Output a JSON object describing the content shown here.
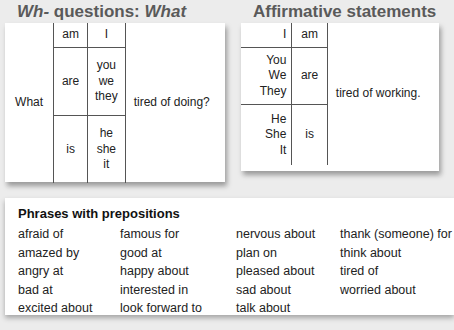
{
  "left_section": {
    "heading_part1": "Wh-",
    "heading_part2": " questions: ",
    "heading_part3": "What",
    "table": {
      "wh_word": "What",
      "rows": [
        {
          "verb": "am",
          "subjects": [
            "I"
          ]
        },
        {
          "verb": "are",
          "subjects": [
            "you",
            "we",
            "they"
          ]
        },
        {
          "verb": "is",
          "subjects": [
            "he",
            "she",
            "it"
          ]
        }
      ],
      "ending": "tired of doing?"
    }
  },
  "right_section": {
    "heading": "Affirmative statements",
    "table": {
      "rows": [
        {
          "subjects": [
            "I"
          ],
          "verb": "am"
        },
        {
          "subjects": [
            "You",
            "We",
            "They"
          ],
          "verb": "are"
        },
        {
          "subjects": [
            "He",
            "She",
            "It"
          ],
          "verb": "is"
        }
      ],
      "ending": "tired of working."
    }
  },
  "phrases": {
    "title": "Phrases with prepositions",
    "columns": [
      [
        "afraid of",
        "amazed by",
        "angry at",
        "bad at",
        "excited about"
      ],
      [
        "famous for",
        "good at",
        "happy about",
        "interested in",
        "look forward to"
      ],
      [
        "nervous about",
        "plan on",
        "pleased about",
        "sad about",
        "talk about"
      ],
      [
        "thank (someone) for",
        "think about",
        "tired of",
        "worried about"
      ]
    ]
  }
}
